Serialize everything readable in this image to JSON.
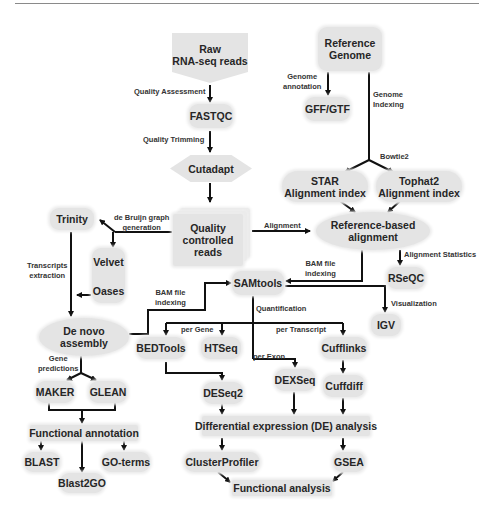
{
  "diagram": {
    "nodes": {
      "raw_reads": "Raw\nRNA-seq reads",
      "reference_genome": "Reference\nGenome",
      "fastqc": "FASTQC",
      "gff_gtf": "GFF/GTF",
      "cutadapt": "Cutadapt",
      "star_index": "STAR\nAlignment index",
      "tophat2_index": "Tophat2\nAlignment index",
      "trinity": "Trinity",
      "quality_controlled_reads": "Quality\ncontrolled\nreads",
      "reference_alignment": "Reference-based\nalignment",
      "velvet": "Velvet",
      "oases": "Oases",
      "samtools": "SAMtools",
      "rseqc": "RSeQC",
      "igv": "IGV",
      "de_novo_assembly": "De novo\nassembly",
      "bedtools": "BEDTools",
      "htseq": "HTSeq",
      "cufflinks": "Cufflinks",
      "dexseq": "DEXSeq",
      "deseq2": "DESeq2",
      "cuffdiff": "Cuffdiff",
      "maker": "MAKER",
      "glean": "GLEAN",
      "de_analysis": "Differential expression (DE) analysis",
      "functional_annotation": "Functional annotation",
      "clusterprofiler": "ClusterProfiler",
      "gsea": "GSEA",
      "blast": "BLAST",
      "go_terms": "GO-terms",
      "blast2go": "Blast2GO",
      "functional_analysis": "Functional analysis"
    },
    "edge_labels": {
      "quality_assessment": "Quality Assessment",
      "quality_trimming": "Quality Trimming",
      "genome_annotation": "Genome\nannotation",
      "genome_indexing": "Genome\nIndexing",
      "bowtie2": "Bowtie2",
      "de_bruijn": "de Bruijn graph\ngeneration",
      "alignment": "Alignment",
      "transcripts_extraction": "Transcripts\nextraction",
      "bam_indexing_left": "BAM file\nindexing",
      "bam_indexing_right": "BAM file\nindexing",
      "alignment_statistics": "Alignment Statistics",
      "visualization": "Visualization",
      "quantification": "Quantification",
      "per_gene": "per Gene",
      "per_transcript": "per Transcript",
      "per_exon": "per Exon",
      "gene_predictions": "Gene\npredictions"
    },
    "colors": {
      "node_fill": "#e4e4e4",
      "arrow": "#111111",
      "text": "#262626"
    }
  }
}
